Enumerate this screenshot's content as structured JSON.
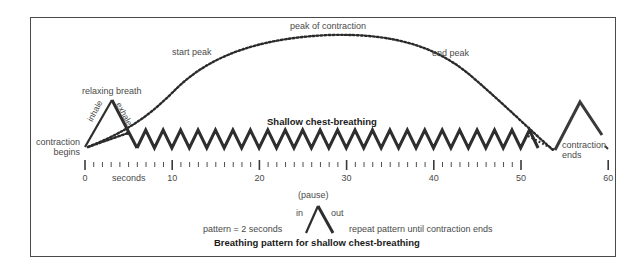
{
  "diagram": {
    "title": "Shallow chest-breathing",
    "curve_labels": {
      "start_peak": "start peak",
      "peak": "peak of contraction",
      "end_peak": "end peak"
    },
    "relaxing_breath": {
      "label": "relaxing breath",
      "inhale": "inhale",
      "exhale": "exhale"
    },
    "contraction_begins": [
      "contraction",
      "begins"
    ],
    "contraction_ends": [
      "contraction",
      "ends"
    ],
    "axis": {
      "unit_label": "seconds",
      "major_ticks": [
        "0",
        "10",
        "20",
        "30",
        "40",
        "50",
        "60"
      ],
      "minor_tick_interval_seconds": 1,
      "range": [
        0,
        60
      ]
    },
    "pattern_legend": {
      "pause": "(pause)",
      "in": "in",
      "out": "out",
      "pattern_text": "pattern = 2 seconds",
      "repeat_text": "repeat pattern until contraction ends",
      "caption": "Breathing pattern for shallow chest-breathing"
    },
    "colors": {
      "line": "#2e2e2e",
      "text": "#4a4a4a",
      "frame": "#4a4a4a",
      "background": "#ffffff"
    }
  }
}
